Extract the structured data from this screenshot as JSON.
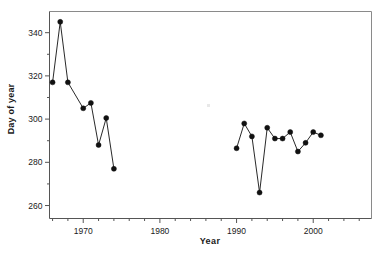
{
  "chart_data": {
    "type": "line",
    "title": "",
    "subtitle": "",
    "xlabel": "Year",
    "ylabel": "Day of year",
    "xlim": [
      1965.6,
      2007.6
    ],
    "ylim": [
      254.0,
      349.8
    ],
    "grid": false,
    "legend": "none",
    "marker": "filled-circle",
    "x_ticks_major": [
      1970,
      1980,
      1990,
      2000
    ],
    "x_tick_labels": [
      "1970",
      "1980",
      "1990",
      "2000"
    ],
    "x_ticks_minor": [
      1966,
      1968,
      1972,
      1974,
      1976,
      1978,
      1982,
      1984,
      1986,
      1988,
      1992,
      1994,
      1996,
      1998,
      2002,
      2004,
      2006
    ],
    "y_ticks_major": [
      260,
      280,
      300,
      320,
      340
    ],
    "y_tick_labels": [
      "260",
      "280",
      "300",
      "320",
      "340"
    ],
    "y_ticks_minor": [
      270,
      290,
      310,
      330
    ],
    "series": [
      {
        "name": "early-period",
        "x": [
          1966,
          1967,
          1968,
          1970,
          1971,
          1972,
          1973,
          1974
        ],
        "values": [
          317,
          345,
          317,
          305,
          307.5,
          288,
          300.5,
          277
        ]
      },
      {
        "name": "late-period",
        "x": [
          1990,
          1991,
          1992,
          1993,
          1994,
          1995,
          1996,
          1997,
          1998,
          1999,
          2000,
          2001
        ],
        "values": [
          286.5,
          298,
          292,
          266,
          296,
          291,
          291,
          294,
          285,
          289,
          294,
          292.5
        ]
      }
    ],
    "colors": {
      "marker": "#111111",
      "line": "#111111",
      "frame": "#8a8a8a",
      "axis": "#555555",
      "text": "#1a1a1a",
      "background": "#ffffff"
    }
  }
}
